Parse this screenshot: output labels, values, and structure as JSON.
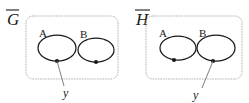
{
  "figure": {
    "type": "diagram",
    "background_color": "#ffffff",
    "stroke_color": "#1a1a1a",
    "panel_border_color": "#b9b9b9",
    "panels": [
      {
        "id": "left",
        "label": "G",
        "label_overline": true,
        "box": {
          "x": 26,
          "y": 16,
          "width": 92,
          "height": 63,
          "radius": 7
        },
        "ellipses": [
          {
            "name": "A",
            "label": "A",
            "label_x": 39,
            "label_y": 37,
            "cx": 57,
            "cy": 48,
            "rx": 19,
            "ry": 13,
            "vertex": {
              "cx": 57,
              "cy": 61,
              "r": 2.1,
              "labelled": true
            }
          },
          {
            "name": "B",
            "label": "B",
            "label_x": 80,
            "label_y": 38,
            "cx": 96,
            "cy": 50,
            "rx": 18,
            "ry": 12,
            "vertex": {
              "cx": 96,
              "cy": 62,
              "r": 2.1,
              "labelled": false
            }
          }
        ],
        "leader_line": {
          "x1": 57,
          "y1": 61,
          "x2": 64,
          "y2": 86
        },
        "vertex_label": {
          "text": "y",
          "x": 63,
          "y": 97
        }
      },
      {
        "id": "right",
        "label": "H",
        "label_overline": true,
        "box": {
          "x": 146,
          "y": 16,
          "width": 96,
          "height": 63,
          "radius": 7
        },
        "ellipses": [
          {
            "name": "A",
            "label": "A",
            "label_x": 159,
            "label_y": 37,
            "cx": 178,
            "cy": 48,
            "rx": 18,
            "ry": 12,
            "vertex": {
              "cx": 174,
              "cy": 60,
              "r": 2.1,
              "labelled": false
            }
          },
          {
            "name": "B",
            "label": "B",
            "label_x": 199,
            "label_y": 37,
            "cx": 216,
            "cy": 48,
            "rx": 19,
            "ry": 13,
            "vertex": {
              "cx": 213,
              "cy": 61,
              "r": 2.1,
              "labelled": true
            }
          }
        ],
        "leader_line": {
          "x1": 213,
          "y1": 61,
          "x2": 202,
          "y2": 88
        },
        "vertex_label": {
          "text": "y",
          "x": 196,
          "y": 99
        }
      }
    ]
  }
}
